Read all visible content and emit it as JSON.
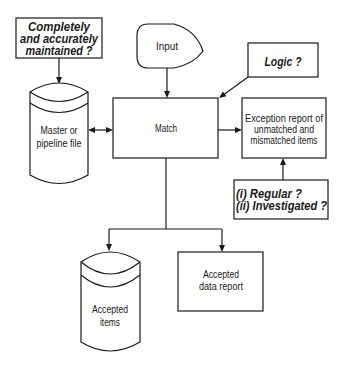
{
  "diagram": {
    "type": "flowchart",
    "nodes": {
      "completeness_check": {
        "shape": "annotation-box",
        "lines": [
          "Completely",
          "and accurately",
          "maintained ?"
        ]
      },
      "input": {
        "shape": "display",
        "lines": [
          "Input"
        ]
      },
      "logic_check": {
        "shape": "annotation-box",
        "lines": [
          "Logic ?"
        ]
      },
      "master_file": {
        "shape": "storage-cylinder",
        "lines": [
          "Master or",
          "pipeline file"
        ]
      },
      "match": {
        "shape": "process-box",
        "lines": [
          "Match"
        ]
      },
      "exception_report": {
        "shape": "process-box",
        "lines": [
          "Exception report of",
          "unmatched and",
          "mismatched items"
        ]
      },
      "review_check": {
        "shape": "annotation-box",
        "lines": [
          "(i) Regular ?",
          "(ii) Investigated ?"
        ]
      },
      "accepted_items": {
        "shape": "storage-cylinder",
        "lines": [
          "Accepted",
          "items"
        ]
      },
      "accepted_report": {
        "shape": "process-box",
        "lines": [
          "Accepted",
          "data report"
        ]
      }
    },
    "edges": [
      {
        "from": "completeness_check",
        "to": "master_file",
        "direction": "one-way"
      },
      {
        "from": "input",
        "to": "match",
        "direction": "one-way"
      },
      {
        "from": "logic_check",
        "to": "match",
        "direction": "one-way"
      },
      {
        "from": "master_file",
        "to": "match",
        "direction": "two-way"
      },
      {
        "from": "match",
        "to": "exception_report",
        "direction": "one-way"
      },
      {
        "from": "review_check",
        "to": "exception_report",
        "direction": "one-way"
      },
      {
        "from": "match",
        "to": "accepted_items",
        "direction": "one-way"
      },
      {
        "from": "match",
        "to": "accepted_report",
        "direction": "one-way"
      }
    ]
  },
  "colors": {
    "background": "#ffffff",
    "line": "#1a1a1a",
    "text": "#1a1a1a"
  }
}
